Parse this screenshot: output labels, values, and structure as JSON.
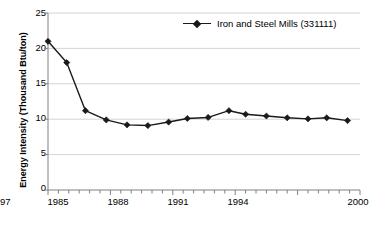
{
  "chart_data": {
    "type": "line",
    "title": "",
    "xlabel": "",
    "ylabel": "Energy Intensity (Thousand Btu/ton)",
    "xlim": [
      1985,
      2000
    ],
    "ylim": [
      0,
      25
    ],
    "grid": true,
    "legend_position": "top-center",
    "y_ticks": [
      0,
      5,
      10,
      15,
      20,
      25
    ],
    "y_tick_labels": [
      "0",
      "5",
      "10",
      "15",
      "20",
      "25"
    ],
    "x_ticks": [
      1985,
      1988,
      1991,
      1994,
      1997,
      2000
    ],
    "x_tick_labels": [
      "1985",
      "1988",
      "1991",
      "1994",
      "1997",
      "2000"
    ],
    "x_minor_tick_step": 0.5,
    "series": [
      {
        "name": "Iron and Steel Mills (331111)",
        "marker": "diamond",
        "color": "#1a1a1a",
        "x": [
          1985.0,
          1985.9,
          1986.8,
          1987.8,
          1988.8,
          1989.8,
          1990.8,
          1991.7,
          1992.7,
          1993.7,
          1994.5,
          1995.5,
          1996.5,
          1997.5,
          1998.4,
          1999.4
        ],
        "values": [
          21.0,
          18.0,
          11.2,
          9.9,
          9.2,
          9.1,
          9.6,
          10.1,
          10.25,
          11.2,
          10.7,
          10.45,
          10.2,
          10.05,
          10.2,
          9.8
        ]
      }
    ]
  },
  "legend": {
    "entry_label": "Iron and Steel Mills (331111)"
  },
  "axes": {
    "y_title": "Energy Intensity (Thousand Btu/ton)"
  }
}
